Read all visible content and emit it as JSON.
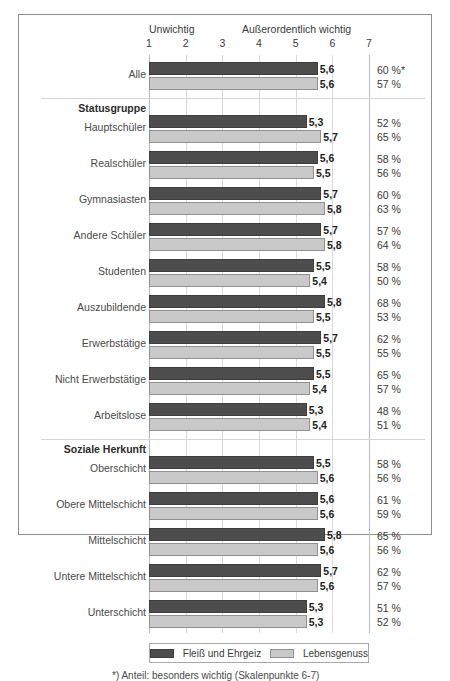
{
  "axis": {
    "left_label": "Unwichtig",
    "right_label": "Außerordentlich wichtig",
    "ticks": [
      "1",
      "2",
      "3",
      "4",
      "5",
      "6",
      "7"
    ],
    "min": 1,
    "max": 7
  },
  "legend": {
    "series_dark": "Fleiß und Ehrgeiz",
    "series_light": "Lebensgenuss"
  },
  "footnote": "*) Anteil: besonders wichtig (Skalenpunkte 6-7)",
  "colors": {
    "dark": "#4d4d4d",
    "light": "#c9c9c9",
    "frame": "#8d8d93",
    "grid": "#d9d9dc"
  },
  "chart_data": {
    "type": "bar",
    "title": "",
    "xlabel": "",
    "ylabel": "",
    "xlim": [
      1,
      7
    ],
    "grid": true,
    "legend_position": "bottom",
    "orientation": "horizontal",
    "series": [
      {
        "name": "Fleiß und Ehrgeiz",
        "color": "#4d4d4d"
      },
      {
        "name": "Lebensgenuss",
        "color": "#c9c9c9"
      }
    ],
    "groups": [
      {
        "header": "",
        "rows": [
          {
            "label": "Alle",
            "dark": 5.6,
            "light": 5.6,
            "dark_text": "5,6",
            "light_text": "5,6",
            "pct_dark": "60 %*",
            "pct_light": "57 %"
          }
        ]
      },
      {
        "header": "Statusgruppe",
        "rows": [
          {
            "label": "Hauptschüler",
            "dark": 5.3,
            "light": 5.7,
            "dark_text": "5,3",
            "light_text": "5,7",
            "pct_dark": "52 %",
            "pct_light": "65 %"
          },
          {
            "label": "Realschüler",
            "dark": 5.6,
            "light": 5.5,
            "dark_text": "5,6",
            "light_text": "5,5",
            "pct_dark": "58 %",
            "pct_light": "56 %"
          },
          {
            "label": "Gymnasiasten",
            "dark": 5.7,
            "light": 5.8,
            "dark_text": "5,7",
            "light_text": "5,8",
            "pct_dark": "60 %",
            "pct_light": "63 %"
          },
          {
            "label": "Andere Schüler",
            "dark": 5.7,
            "light": 5.8,
            "dark_text": "5,7",
            "light_text": "5,8",
            "pct_dark": "57 %",
            "pct_light": "64 %"
          },
          {
            "label": "Studenten",
            "dark": 5.5,
            "light": 5.4,
            "dark_text": "5,5",
            "light_text": "5,4",
            "pct_dark": "58 %",
            "pct_light": "50 %"
          },
          {
            "label": "Auszubildende",
            "dark": 5.8,
            "light": 5.5,
            "dark_text": "5,8",
            "light_text": "5,5",
            "pct_dark": "68 %",
            "pct_light": "53 %"
          },
          {
            "label": "Erwerbstätige",
            "dark": 5.7,
            "light": 5.5,
            "dark_text": "5,7",
            "light_text": "5,5",
            "pct_dark": "62 %",
            "pct_light": "55 %"
          },
          {
            "label": "Nicht Erwerbstätige",
            "dark": 5.5,
            "light": 5.4,
            "dark_text": "5,5",
            "light_text": "5,4",
            "pct_dark": "65 %",
            "pct_light": "57 %"
          },
          {
            "label": "Arbeitslose",
            "dark": 5.3,
            "light": 5.4,
            "dark_text": "5,3",
            "light_text": "5,4",
            "pct_dark": "48 %",
            "pct_light": "51 %"
          }
        ]
      },
      {
        "header": "Soziale Herkunft",
        "rows": [
          {
            "label": "Oberschicht",
            "dark": 5.5,
            "light": 5.6,
            "dark_text": "5,5",
            "light_text": "5,6",
            "pct_dark": "58 %",
            "pct_light": "56 %"
          },
          {
            "label": "Obere Mittelschicht",
            "dark": 5.6,
            "light": 5.6,
            "dark_text": "5,6",
            "light_text": "5,6",
            "pct_dark": "61 %",
            "pct_light": "59 %"
          },
          {
            "label": "Mittelschicht",
            "dark": 5.8,
            "light": 5.6,
            "dark_text": "5,8",
            "light_text": "5,6",
            "pct_dark": "65 %",
            "pct_light": "56 %"
          },
          {
            "label": "Untere Mittelschicht",
            "dark": 5.7,
            "light": 5.6,
            "dark_text": "5,7",
            "light_text": "5,6",
            "pct_dark": "62 %",
            "pct_light": "57 %"
          },
          {
            "label": "Unterschicht",
            "dark": 5.3,
            "light": 5.3,
            "dark_text": "5,3",
            "light_text": "5,3",
            "pct_dark": "51 %",
            "pct_light": "52 %"
          }
        ]
      }
    ]
  }
}
